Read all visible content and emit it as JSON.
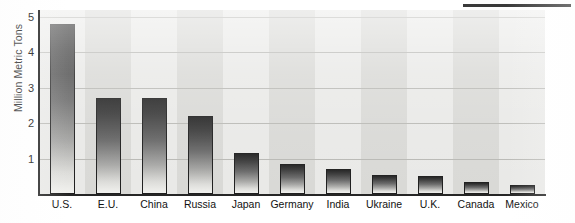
{
  "chart_data": {
    "type": "bar",
    "title": "",
    "subtitle": "",
    "xlabel": "",
    "ylabel": "Million Metric Tons",
    "categories": [
      "U.S.",
      "E.U.",
      "China",
      "Russia",
      "Japan",
      "Germany",
      "India",
      "Ukraine",
      "U.K.",
      "Canada",
      "Mexico"
    ],
    "values": [
      4.8,
      2.7,
      2.7,
      2.2,
      1.15,
      0.85,
      0.7,
      0.55,
      0.5,
      0.35,
      0.25
    ],
    "ylim": [
      0,
      5.2
    ],
    "yticks": [
      1,
      2,
      3,
      4,
      5
    ],
    "ytick_labels": [
      "1",
      "2",
      "3",
      "4",
      "5"
    ],
    "grid": true,
    "grid_axis": "y",
    "legend": false,
    "legend_position": "none",
    "bar_fill": "#3a3a3a",
    "bar_edge": "#1f1f1f",
    "plot_background": "#e3e3e0",
    "band_light": "#e9e9e7",
    "band_dark": "#d9d9d6",
    "gridline_color": "#b9b9b5",
    "axis_color": "#262626"
  },
  "decorations": {
    "top_rule_color": "#3a3a3a"
  }
}
